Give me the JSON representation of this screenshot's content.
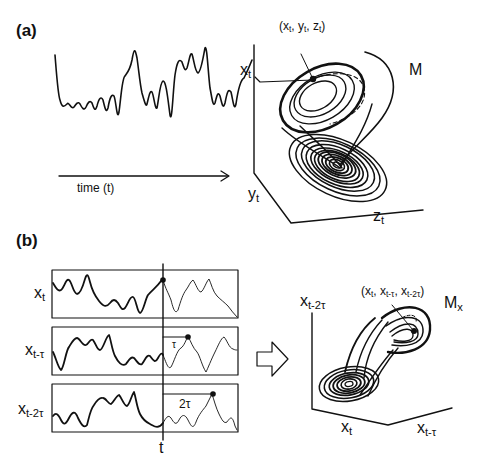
{
  "panel_a": {
    "label": "(a)",
    "time_label": "time (t)",
    "state_label": "(x",
    "state_label_full": "(xt, yt, zt)",
    "manifold_label": "M",
    "axis_x": "x",
    "axis_x_sub": "t",
    "axis_y": "y",
    "axis_y_sub": "t",
    "axis_z": "z",
    "axis_z_sub": "t"
  },
  "panel_b": {
    "label": "(b)",
    "series": [
      {
        "name": "xt",
        "base": "x",
        "sub": "t"
      },
      {
        "name": "xt-τ",
        "base": "x",
        "sub": "t-τ"
      },
      {
        "name": "xt-2τ",
        "base": "x",
        "sub": "t-2τ"
      }
    ],
    "time_marker": "t",
    "lag1": "τ",
    "lag2": "2τ",
    "embedded_point_full": "(xt, xt-τ, xt-2τ)",
    "manifold_label": "M",
    "manifold_sub": "x",
    "axis_vertical": "x",
    "axis_vertical_sub": "t-2τ",
    "axis_left": "x",
    "axis_left_sub": "t",
    "axis_right": "x",
    "axis_right_sub": "t-τ",
    "arrow_icon": "hollow-right-arrow"
  },
  "colors": {
    "ink": "#111111",
    "background": "#ffffff"
  }
}
